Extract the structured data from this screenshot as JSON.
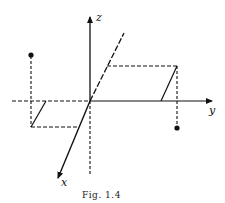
{
  "figure": {
    "caption": "Fig. 1.4",
    "axes": {
      "x_label": "x",
      "y_label": "y",
      "z_label": "z"
    },
    "colors": {
      "ink": "#111111",
      "background": "#ffffff"
    }
  }
}
